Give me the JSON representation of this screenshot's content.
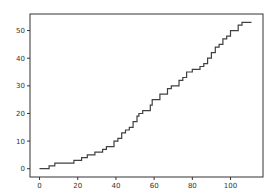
{
  "chart_data": {
    "type": "line",
    "title": "",
    "xlabel": "",
    "ylabel": "",
    "xlim": [
      -5,
      117
    ],
    "ylim": [
      -3,
      56
    ],
    "grid": false,
    "legend": null,
    "xticks": [
      0,
      20,
      40,
      60,
      80,
      100
    ],
    "yticks": [
      0,
      10,
      20,
      30,
      40,
      50
    ],
    "line_color": "#404040",
    "series": [
      {
        "name": "series-1",
        "x": [
          0,
          3,
          5,
          7,
          8,
          12,
          17,
          18,
          21,
          22,
          24,
          25,
          27,
          29,
          31,
          33,
          35,
          37,
          39,
          41,
          43,
          45,
          47,
          49,
          51,
          52,
          54,
          56,
          58,
          59,
          61,
          63,
          65,
          67,
          69,
          71,
          73,
          75,
          77,
          78,
          80,
          82,
          84,
          86,
          88,
          90,
          92,
          94,
          96,
          98,
          100,
          102,
          104,
          106,
          108,
          111
        ],
        "y": [
          0,
          0,
          1,
          1,
          2,
          2,
          2,
          3,
          3,
          4,
          4,
          5,
          5,
          6,
          6,
          7,
          8,
          8,
          10,
          11,
          13,
          14,
          15,
          17,
          19,
          20,
          21,
          21,
          23,
          25,
          25,
          27,
          27,
          29,
          30,
          30,
          32,
          33,
          35,
          35,
          36,
          36,
          37,
          38,
          40,
          42,
          44,
          45,
          47,
          48,
          50,
          50,
          52,
          53,
          53,
          53
        ]
      }
    ]
  }
}
